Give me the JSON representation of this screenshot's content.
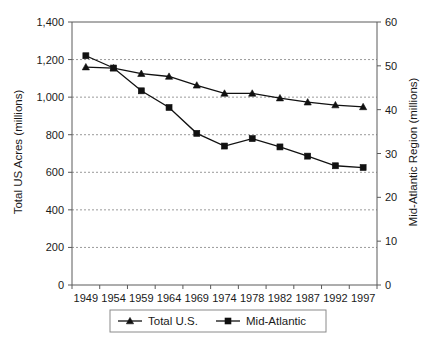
{
  "chart_data": {
    "type": "line",
    "title": "",
    "subtitle": "",
    "xlabel": "",
    "ylabel": "Total US Acres (millions)",
    "y2label": "Mid-Atlantic Region (millions)",
    "categories": [
      "1949",
      "1954",
      "1959",
      "1964",
      "1969",
      "1974",
      "1978",
      "1982",
      "1987",
      "1992",
      "1997"
    ],
    "ylim": [
      0,
      1400
    ],
    "yticks": [
      "0",
      "200",
      "400",
      "600",
      "800",
      "1,000",
      "1,200",
      "1,400"
    ],
    "ytick_values": [
      0,
      200,
      400,
      600,
      800,
      1000,
      1200,
      1400
    ],
    "y2lim": [
      0,
      60
    ],
    "y2ticks": [
      "0",
      "10",
      "20",
      "30",
      "40",
      "50",
      "60"
    ],
    "y2tick_values": [
      0,
      10,
      20,
      30,
      40,
      50,
      60
    ],
    "grid": true,
    "legend_position": "bottom",
    "series": [
      {
        "name": "Total U.S.",
        "axis": "left",
        "marker": "triangle",
        "values": [
          1160,
          1155,
          1125,
          1110,
          1063,
          1020,
          1020,
          995,
          973,
          958,
          948
        ]
      },
      {
        "name": "Mid-Atlantic",
        "axis": "right",
        "marker": "square",
        "values": [
          52.3,
          49.5,
          44.3,
          40.5,
          34.6,
          31.7,
          33.4,
          31.5,
          29.4,
          27.2,
          26.8
        ]
      }
    ]
  },
  "legend": {
    "items": [
      {
        "label": "Total U.S.",
        "marker": "triangle"
      },
      {
        "label": "Mid-Atlantic",
        "marker": "square"
      }
    ]
  }
}
